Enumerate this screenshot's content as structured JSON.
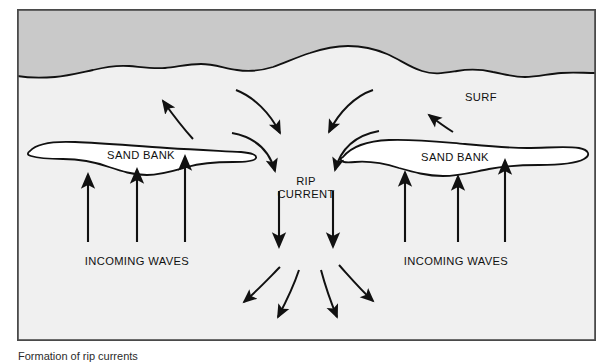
{
  "figure": {
    "number": "Figure 269",
    "caption": "Formation of rip currents"
  },
  "colors": {
    "beach": "#c9c9c9",
    "water": "#f0f0f0",
    "sandbank_fill": "#ffffff",
    "outline": "#111111",
    "border": "#4a4a4a",
    "page_background": "#ffffff",
    "text": "#111111"
  },
  "diagram": {
    "title": "Formation of rip currents",
    "regions": [
      {
        "name": "beach",
        "label": ""
      },
      {
        "name": "water",
        "label": ""
      }
    ],
    "labels": {
      "sand_bank_left": "SAND BANK",
      "sand_bank_right": "SAND BANK",
      "rip_current_line1": "RIP",
      "rip_current_line2": "CURRENT",
      "surf": "SURF",
      "incoming_waves_left": "INCOMING WAVES",
      "incoming_waves_right": "INCOMING WAVES"
    },
    "flow": {
      "incoming_wave_arrows_left": 3,
      "incoming_wave_arrows_right": 3,
      "longshore_feeder_arrows": 4,
      "rip_head_arrows": 2,
      "diverging_outflow_arrows": 4,
      "surf_arrows": 2
    }
  }
}
